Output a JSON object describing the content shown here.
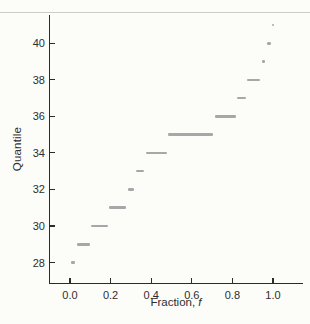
{
  "figure": {
    "background_color": "#fcfcf9",
    "top_rule_color": "#ccccc8"
  },
  "chart_data": {
    "type": "scatter",
    "subtype": "quantile-plot",
    "title": "",
    "ylabel": "Quantile",
    "xlabel_prefix": "Fraction, ",
    "xlabel_symbol": "f",
    "x_ticks": [
      0.0,
      0.2,
      0.4,
      0.6,
      0.8,
      1.0
    ],
    "x_tick_labels": [
      "0.0",
      "0.2",
      "0.4",
      "0.6",
      "0.8",
      "1.0"
    ],
    "y_ticks": [
      28,
      30,
      32,
      34,
      36,
      38,
      40
    ],
    "y_tick_labels": [
      "28",
      "30",
      "32",
      "34",
      "36",
      "38",
      "40"
    ],
    "xlim": [
      -0.1,
      1.15
    ],
    "ylim": [
      26.8,
      41.6
    ],
    "grid": false,
    "legend": "none",
    "axis_color": "#2b2b2b",
    "marker_color": "#a7a7a9",
    "runs": [
      {
        "quantile": 28,
        "f_start": 0.0,
        "f_end": 0.03
      },
      {
        "quantile": 29,
        "f_start": 0.03,
        "f_end": 0.1
      },
      {
        "quantile": 30,
        "f_start": 0.1,
        "f_end": 0.19
      },
      {
        "quantile": 31,
        "f_start": 0.19,
        "f_end": 0.28
      },
      {
        "quantile": 32,
        "f_start": 0.28,
        "f_end": 0.32
      },
      {
        "quantile": 33,
        "f_start": 0.32,
        "f_end": 0.37
      },
      {
        "quantile": 34,
        "f_start": 0.37,
        "f_end": 0.48
      },
      {
        "quantile": 35,
        "f_start": 0.48,
        "f_end": 0.71
      },
      {
        "quantile": 36,
        "f_start": 0.71,
        "f_end": 0.82
      },
      {
        "quantile": 37,
        "f_start": 0.82,
        "f_end": 0.87
      },
      {
        "quantile": 38,
        "f_start": 0.87,
        "f_end": 0.94
      },
      {
        "quantile": 39,
        "f_start": 0.94,
        "f_end": 0.965
      },
      {
        "quantile": 40,
        "f_start": 0.965,
        "f_end": 0.995
      },
      {
        "quantile": 41,
        "f_start": 0.99,
        "f_end": 1.0
      }
    ]
  }
}
